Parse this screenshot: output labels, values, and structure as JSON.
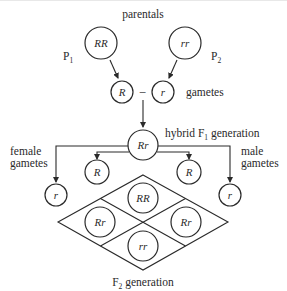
{
  "diagram": {
    "title_label": "parentals",
    "parents": {
      "p1": {
        "label": "P",
        "subscript": "1",
        "genotype": "RR"
      },
      "p2": {
        "label": "P",
        "subscript": "2",
        "genotype": "rr"
      }
    },
    "gametes": {
      "label": "gametes",
      "items": [
        "R",
        "r"
      ],
      "separator": "–"
    },
    "f1": {
      "label_prefix": "hybrid F",
      "label_subscript": "1",
      "label_suffix": " generation",
      "genotype": "Rr"
    },
    "female_gametes": {
      "label_line1": "female",
      "label_line2": "gametes",
      "items": [
        "r",
        "R"
      ]
    },
    "male_gametes": {
      "label_line1": "male",
      "label_line2": "gametes",
      "items": [
        "R",
        "r"
      ]
    },
    "punnett": {
      "cells": {
        "top": "RR",
        "left": "Rr",
        "right": "Rr",
        "bottom": "rr"
      }
    },
    "f2": {
      "label_prefix": "F",
      "label_subscript": "2",
      "label_suffix": " generation"
    }
  }
}
